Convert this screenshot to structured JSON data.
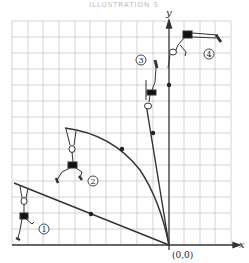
{
  "header": {
    "text": "ILLUSTRATION 5"
  },
  "axes": {
    "x_label": "x",
    "y_label": "y",
    "origin_label": "(0,0)"
  },
  "positions": [
    {
      "id": 1,
      "label": "1",
      "pole": "straight, low angle"
    },
    {
      "id": 2,
      "label": "2",
      "pole": "bent"
    },
    {
      "id": 3,
      "label": "3",
      "pole": "straight, near vertical"
    },
    {
      "id": 4,
      "label": "4",
      "pole": "none, above bar"
    }
  ],
  "colors": {
    "grid": "#c8c8c8",
    "ink": "#333333",
    "background": "#ffffff"
  }
}
